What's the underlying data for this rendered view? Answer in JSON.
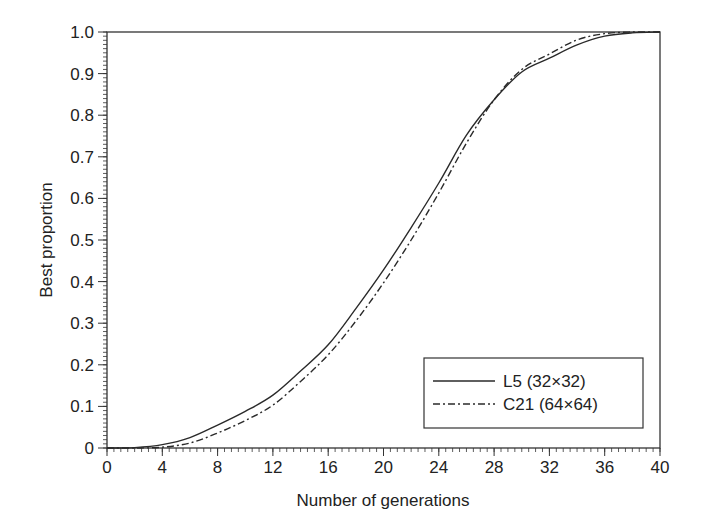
{
  "chart_data": {
    "type": "line",
    "title": "",
    "xlabel": "Number of generations",
    "ylabel": "Best proportion",
    "xlim": [
      0,
      40
    ],
    "ylim": [
      0,
      1.0
    ],
    "x_ticks": [
      0,
      4,
      8,
      12,
      16,
      20,
      24,
      28,
      32,
      36,
      40
    ],
    "x_tick_labels": [
      "0",
      "4",
      "8",
      "12",
      "16",
      "20",
      "24",
      "28",
      "32",
      "36",
      "40"
    ],
    "y_ticks": [
      0,
      0.1,
      0.2,
      0.3,
      0.4,
      0.5,
      0.6,
      0.7,
      0.8,
      0.9,
      1.0
    ],
    "y_tick_labels": [
      "0",
      "0.1",
      "0.2",
      "0.3",
      "0.4",
      "0.5",
      "0.6",
      "0.7",
      "0.8",
      "0.9",
      "1.0"
    ],
    "grid": false,
    "legend_position": "lower right",
    "x": [
      0,
      2,
      4,
      6,
      8,
      10,
      12,
      14,
      16,
      18,
      20,
      22,
      24,
      26,
      28,
      30,
      32,
      34,
      36,
      38,
      40
    ],
    "series": [
      {
        "name": "L5 (32×32)",
        "style": "solid",
        "values": [
          0,
          0.001,
          0.008,
          0.025,
          0.055,
          0.088,
          0.127,
          0.185,
          0.248,
          0.335,
          0.428,
          0.53,
          0.637,
          0.752,
          0.837,
          0.904,
          0.937,
          0.969,
          0.99,
          0.998,
          1.0
        ]
      },
      {
        "name": "C21 (64×64)",
        "style": "dash-dot",
        "values": [
          0,
          0.0,
          0.002,
          0.012,
          0.036,
          0.066,
          0.103,
          0.16,
          0.224,
          0.305,
          0.397,
          0.5,
          0.613,
          0.733,
          0.837,
          0.91,
          0.947,
          0.981,
          0.996,
          1.0,
          1.0
        ]
      }
    ]
  },
  "legend": {
    "items": [
      {
        "label": "L5 (32×32)",
        "style": "solid"
      },
      {
        "label": "C21 (64×64)",
        "style": "dash-dot"
      }
    ]
  },
  "colors": {
    "line": "#2a2a2a",
    "axis": "#333333",
    "background": "#ffffff"
  }
}
